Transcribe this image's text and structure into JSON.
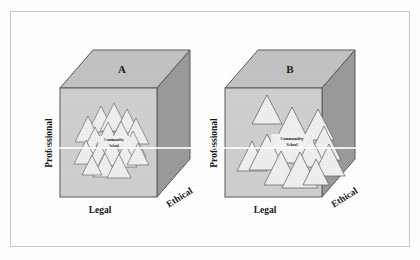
{
  "figure": {
    "title": "",
    "background": "#ffffff",
    "frame_color": "#c9c9c9"
  },
  "colors": {
    "cube_front": "#cfcfcf",
    "cube_top": "#c2c2c2",
    "cube_side": "#9a9a9a",
    "cube_outline": "#5a5a5a",
    "triangle_fill": "#efefef",
    "triangle_outline": "#6b6b6b",
    "text": "#1a1a1a",
    "core_box": "#f2f2f2"
  },
  "panels": [
    {
      "id": "A",
      "letter": "A",
      "axes": {
        "vertical": "Professional",
        "horizontal": "Legal",
        "depth": "Ethical"
      },
      "core_label_lines": [
        "Communality",
        "School"
      ],
      "cluster_description": "dense tightly-packed cluster of small triangles",
      "triangles": [
        {
          "cx": 101,
          "cy": 119,
          "size": 13
        },
        {
          "cx": 114,
          "cy": 117,
          "size": 14
        },
        {
          "cx": 127,
          "cy": 121,
          "size": 12
        },
        {
          "cx": 88,
          "cy": 129,
          "size": 13
        },
        {
          "cx": 136,
          "cy": 131,
          "size": 13
        },
        {
          "cx": 95,
          "cy": 141,
          "size": 14
        },
        {
          "cx": 108,
          "cy": 134,
          "size": 12
        },
        {
          "cx": 121,
          "cy": 133,
          "size": 12
        },
        {
          "cx": 133,
          "cy": 144,
          "size": 13
        },
        {
          "cx": 86,
          "cy": 152,
          "size": 12
        },
        {
          "cx": 99,
          "cy": 156,
          "size": 13
        },
        {
          "cx": 112,
          "cy": 152,
          "size": 14
        },
        {
          "cx": 125,
          "cy": 156,
          "size": 12
        },
        {
          "cx": 138,
          "cy": 154,
          "size": 11
        },
        {
          "cx": 105,
          "cy": 165,
          "size": 12
        },
        {
          "cx": 119,
          "cy": 166,
          "size": 12
        },
        {
          "cx": 92,
          "cy": 165,
          "size": 10
        }
      ]
    },
    {
      "id": "B",
      "letter": "B",
      "axes": {
        "vertical": "Professional",
        "horizontal": "Legal",
        "depth": "Ethical"
      },
      "core_label_lines": [
        "Communality",
        "School"
      ],
      "cluster_description": "dispersed cluster of larger spread-out triangles",
      "triangles": [
        {
          "cx": 267,
          "cy": 110,
          "size": 15
        },
        {
          "cx": 292,
          "cy": 135,
          "size": 28
        },
        {
          "cx": 318,
          "cy": 125,
          "size": 16
        },
        {
          "cx": 324,
          "cy": 143,
          "size": 17
        },
        {
          "cx": 311,
          "cy": 152,
          "size": 15
        },
        {
          "cx": 329,
          "cy": 160,
          "size": 16
        },
        {
          "cx": 252,
          "cy": 156,
          "size": 15
        },
        {
          "cx": 267,
          "cy": 152,
          "size": 18
        },
        {
          "cx": 281,
          "cy": 168,
          "size": 17
        },
        {
          "cx": 300,
          "cy": 170,
          "size": 18
        },
        {
          "cx": 316,
          "cy": 172,
          "size": 13
        }
      ]
    }
  ]
}
